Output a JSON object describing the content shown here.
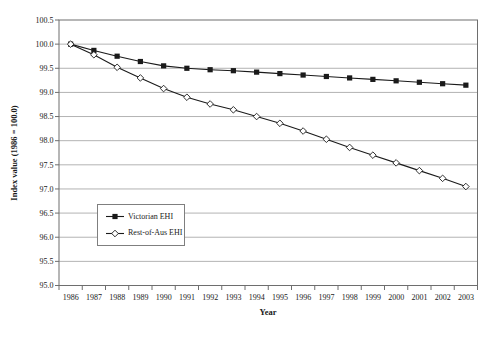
{
  "figure": {
    "background": "#ffffff"
  },
  "chart_data": {
    "type": "line",
    "title": "",
    "xlabel": "Year",
    "ylabel": "Index value (1986 = 100.0)",
    "categories": [
      "1986",
      "1987",
      "1988",
      "1989",
      "1990",
      "1991",
      "1992",
      "1993",
      "1994",
      "1995",
      "1996",
      "1997",
      "1998",
      "1999",
      "2000",
      "2001",
      "2002",
      "2003"
    ],
    "ylim": [
      95.0,
      100.5
    ],
    "ytick_step": 0.5,
    "ytick_labels": [
      "100.5",
      "100.0",
      "99.5",
      "99.0",
      "98.5",
      "98.0",
      "97.5",
      "97.0",
      "96.5",
      "96.0",
      "95.5",
      "95.0"
    ],
    "grid": true,
    "legend_position": "inside-lower-left",
    "axis_color": "#6e6e6e",
    "grid_color": "#b3b3b3",
    "series": [
      {
        "name": "Victorian EHI",
        "marker": "filled-square",
        "color": "#1a1a1a",
        "values": [
          100.0,
          99.87,
          99.75,
          99.64,
          99.55,
          99.5,
          99.47,
          99.45,
          99.42,
          99.39,
          99.36,
          99.33,
          99.3,
          99.27,
          99.24,
          99.21,
          99.18,
          99.15
        ]
      },
      {
        "name": "Rest-of-Aus EHI",
        "marker": "open-diamond",
        "color": "#1a1a1a",
        "values": [
          100.0,
          99.78,
          99.52,
          99.3,
          99.08,
          98.9,
          98.76,
          98.64,
          98.5,
          98.36,
          98.2,
          98.03,
          97.86,
          97.7,
          97.54,
          97.38,
          97.22,
          97.05
        ]
      }
    ]
  }
}
